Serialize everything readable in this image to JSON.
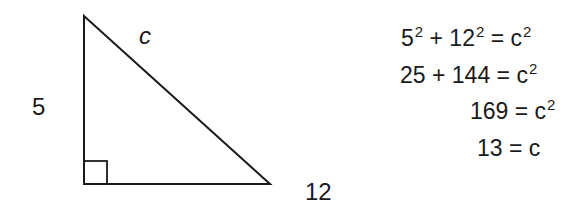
{
  "diagram": {
    "type": "right-triangle",
    "labels": {
      "hypotenuse": "c",
      "vertical_leg": "5",
      "horizontal_leg": "12"
    },
    "right_angle_marker": true
  },
  "equations": [
    {
      "parts": [
        "5",
        "2",
        " + 12",
        "2",
        " = c",
        "2"
      ]
    },
    {
      "parts": [
        "25 + 144 = c",
        "2"
      ]
    },
    {
      "parts": [
        "169 = c",
        "2"
      ]
    },
    {
      "parts": [
        "13 = c"
      ]
    }
  ],
  "colors": {
    "stroke": "#1a1a1a",
    "background": "#ffffff"
  }
}
